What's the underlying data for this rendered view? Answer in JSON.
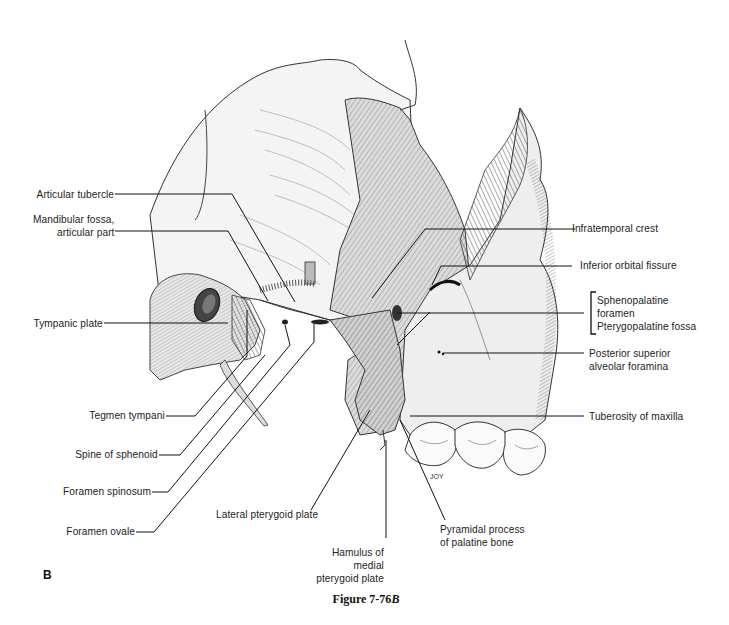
{
  "figure": {
    "panel_letter": "B",
    "caption_prefix": "Figure 7-76",
    "caption_suffix": "B"
  },
  "labels": {
    "left": [
      {
        "id": "articular-tubercle",
        "text": "Articular tubercle"
      },
      {
        "id": "mandibular-fossa",
        "line1": "Mandibular fossa,",
        "line2": "articular part"
      },
      {
        "id": "tympanic-plate",
        "text": "Tympanic plate"
      },
      {
        "id": "tegmen-tympani",
        "text": "Tegmen tympani"
      },
      {
        "id": "spine-of-sphenoid",
        "text": "Spine of sphenoid"
      },
      {
        "id": "foramen-spinosum",
        "text": "Foramen spinosum"
      },
      {
        "id": "foramen-ovale",
        "text": "Foramen ovale"
      }
    ],
    "right": [
      {
        "id": "infratemporal-crest",
        "text": "Infratemporal crest"
      },
      {
        "id": "inferior-orbital-fissure",
        "text": "Inferior orbital fissure"
      },
      {
        "id": "sphenopalatine-foramen",
        "line1": "Sphenopalatine",
        "line2": "foramen"
      },
      {
        "id": "pterygopalatine-fossa",
        "text": "Pterygopalatine fossa"
      },
      {
        "id": "posterior-superior-alveolar",
        "line1": "Posterior superior",
        "line2": "alveolar foramina"
      },
      {
        "id": "tuberosity-of-maxilla",
        "text": "Tuberosity of maxilla"
      }
    ],
    "bottom": [
      {
        "id": "lateral-pterygoid-plate",
        "text": "Lateral pterygoid plate"
      },
      {
        "id": "hamulus",
        "line1": "Hamulus of",
        "line2": "medial",
        "line3": "pterygoid plate"
      },
      {
        "id": "pyramidal-process",
        "line1": "Pyramidal process",
        "line2": "of palatine bone"
      }
    ]
  },
  "artist_signature": "JOY"
}
